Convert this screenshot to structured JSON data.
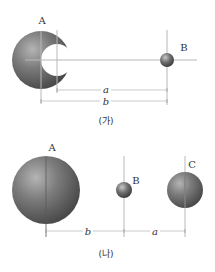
{
  "figure_ga": {
    "caption": "(가)",
    "sphere_a_label": "A",
    "sphere_b_label": "B",
    "dim_a_label": "a",
    "dim_b_label": "b",
    "description": "Sphere A with spherical cavity; distance a from cavity center to B, distance b from A center to B"
  },
  "figure_na": {
    "caption": "(나)",
    "sphere_a_label": "A",
    "sphere_b_label": "B",
    "sphere_c_label": "C",
    "dim_b_label": "b",
    "dim_a_label": "a",
    "description": "Solid sphere A, small sphere B at distance b, sphere C at distance a from B"
  },
  "colors": {
    "sphere_dark": "#4a4a4a",
    "sphere_mid": "#7a7a7a",
    "sphere_light": "#b0b0b0",
    "guide_line": "#b8b8b8"
  }
}
